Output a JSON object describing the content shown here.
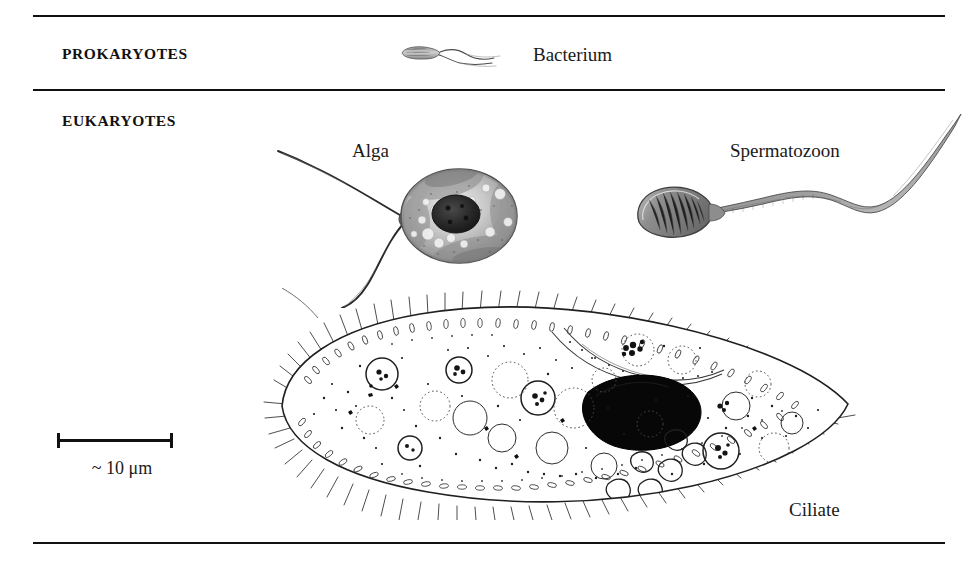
{
  "figure": {
    "background_color": "#ffffff",
    "ink_color": "#111111"
  },
  "rules": {
    "top": "",
    "middle": "",
    "bottom": ""
  },
  "groups": [
    {
      "label": "PROKARYOTES"
    },
    {
      "label": "EUKARYOTES"
    }
  ],
  "group_labels": {
    "prokaryotes": "PROKARYOTES",
    "eukaryotes": "EUKARYOTES"
  },
  "organisms": [
    {
      "name": "bacterium",
      "label": "Bacterium",
      "group": "PROKARYOTES",
      "description": "rod-shaped cell with trailing flagella"
    },
    {
      "name": "alga",
      "label": "Alga",
      "group": "EUKARYOTES",
      "description": "oval cell with dark nucleus and two long flagella"
    },
    {
      "name": "spermatozoon",
      "label": "Spermatozoon",
      "group": "EUKARYOTES",
      "description": "oval head with long S-curved tail"
    },
    {
      "name": "ciliate",
      "label": "Ciliate",
      "group": "EUKARYOTES",
      "description": "large stippled cell with black macronucleus, food vacuoles and ciliated membrane"
    }
  ],
  "organism_labels": {
    "bacterium": "Bacterium",
    "alga": "Alga",
    "spermatozoon": "Spermatozoon",
    "ciliate": "Ciliate"
  },
  "scale_bar": {
    "approx_symbol": "~",
    "value": "10",
    "unit": "μm",
    "label": "~ 10 μm"
  }
}
